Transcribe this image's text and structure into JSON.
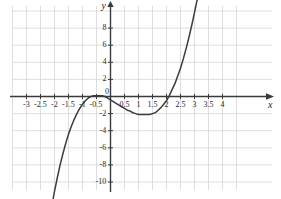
{
  "chart_data": {
    "type": "line",
    "title": "",
    "subtitle": "",
    "xlabel": "x",
    "ylabel": "y",
    "xlim": [
      -3.5,
      4.5
    ],
    "ylim": [
      -11.5,
      10.5
    ],
    "x_ticks": [
      -3,
      -2.5,
      -2,
      -1.5,
      -1,
      -0.5,
      0,
      0.5,
      1,
      1.5,
      2,
      2.5,
      3,
      3.5,
      4
    ],
    "x_tick_labels": [
      "-3",
      "-2.5",
      "-2",
      "-1.5",
      "-1",
      "-0.5",
      "0",
      "0.5",
      "1",
      "1.5",
      "2",
      "2.5",
      "3",
      "3.5",
      "4"
    ],
    "y_ticks": [
      8,
      6,
      4,
      2,
      0,
      -2,
      -4,
      -6,
      -8,
      -10
    ],
    "y_tick_labels": [
      "8",
      "6",
      "4",
      "2",
      "0",
      "-2",
      "-4",
      "-6",
      "-8",
      "-10"
    ],
    "grid": true,
    "grid_color": "#d6d6d6",
    "grid_x_step": 0.5,
    "grid_y_step": 2,
    "axis_color": "#3a3a3a",
    "curve_color": "#3c3c3c",
    "background_color": "#ffffff",
    "legend": [],
    "legend_position": "none",
    "annotations": [],
    "series": [
      {
        "name": "cubic curve",
        "color": "#3c3c3c",
        "roots": [
          -0.8,
          2.15
        ],
        "local_max": {
          "x": -0.3,
          "y": 0.1
        },
        "local_min": {
          "x": 1.4,
          "y": -2.1
        },
        "x": [
          -2.05,
          -2.0,
          -1.9,
          -1.8,
          -1.7,
          -1.6,
          -1.5,
          -1.4,
          -1.3,
          -1.2,
          -1.1,
          -1.0,
          -0.9,
          -0.8,
          -0.7,
          -0.6,
          -0.5,
          -0.4,
          -0.3,
          -0.2,
          -0.1,
          0.0,
          0.1,
          0.2,
          0.3,
          0.4,
          0.5,
          0.6,
          0.7,
          0.8,
          0.9,
          1.0,
          1.1,
          1.2,
          1.3,
          1.4,
          1.5,
          1.6,
          1.7,
          1.8,
          1.9,
          2.0,
          2.1,
          2.2,
          2.3,
          2.4,
          2.5,
          2.6,
          2.7,
          2.8,
          2.9,
          3.0,
          3.1,
          3.2
        ],
        "y": [
          -12.0,
          -11.1,
          -9.5,
          -8.0,
          -6.7,
          -5.5,
          -4.4,
          -3.5,
          -2.7,
          -2.0,
          -1.4,
          -0.9,
          -0.5,
          -0.2,
          0.0,
          0.1,
          0.1,
          0.1,
          0.1,
          0.0,
          -0.2,
          -0.4,
          -0.6,
          -0.8,
          -1.0,
          -1.2,
          -1.4,
          -1.6,
          -1.7,
          -1.9,
          -2.0,
          -2.1,
          -2.1,
          -2.1,
          -2.1,
          -2.1,
          -2.0,
          -1.9,
          -1.6,
          -1.3,
          -0.9,
          -0.5,
          0.1,
          0.8,
          1.5,
          2.4,
          3.3,
          4.4,
          5.6,
          6.9,
          8.3,
          9.8,
          11.4,
          13.2
        ]
      }
    ]
  },
  "axes": {
    "x_name": "x",
    "y_name": "y"
  }
}
